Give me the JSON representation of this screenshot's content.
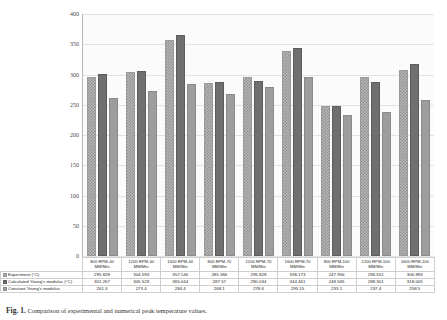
{
  "chart_data": {
    "type": "bar",
    "title": "",
    "xlabel": "",
    "ylabel": "Temperature °C",
    "ylim": [
      0,
      400
    ],
    "yticks": [
      0,
      50,
      100,
      150,
      200,
      250,
      300,
      350,
      400
    ],
    "grid": true,
    "legend_position": "data-table-rows",
    "categories": [
      "800 RPM-40 MM/Min",
      "1200 RPM-40 MM/Min",
      "1600 RPM-40 MM/Min",
      "800 RPM-70 MM/Min",
      "1200 RPM-70 MM/Min",
      "1600 RPM-70 MM/Min",
      "800 RPM-100 MM/Min",
      "1200 RPM-100 MM/Min",
      "1600 RPM-100 MM/Min"
    ],
    "categories_line1": [
      "800 RPM-40",
      "1200 RPM-40",
      "1600 RPM-40",
      "800 RPM-70",
      "1200 RPM-70",
      "1600 RPM-70",
      "800 RPM-100",
      "1200 RPM-100",
      "1600 RPM-100"
    ],
    "categories_line2": [
      "MM/Min",
      "MM/Min",
      "MM/Min",
      "MM/Min",
      "MM/Min",
      "MM/Min",
      "MM/Min",
      "MM/Min",
      "MM/Min"
    ],
    "series": [
      {
        "name": "Experiment (°C)",
        "style": "hatched",
        "color": "#b6b6b6",
        "values": [
          295.828,
          304.593,
          357.146,
          285.366,
          295.828,
          338.173,
          247.956,
          296.551,
          306.893
        ]
      },
      {
        "name": "Calculated Young's modulus (°C)",
        "style": "solid-dark",
        "color": "#6f6f6f",
        "values": [
          301.267,
          305.529,
          365.044,
          287.57,
          290.034,
          344.461,
          248.565,
          288.301,
          318.005
        ]
      },
      {
        "name": "Constant Young's modulus",
        "style": "solid-mid",
        "color": "#9d9d9d",
        "values": [
          261.3,
          273.4,
          284.4,
          268.1,
          278.6,
          295.15,
          233.1,
          237.4,
          258.5
        ]
      }
    ]
  },
  "caption": {
    "lead": "Fig. 1.",
    "text": "   Comparison of experimental and numerical peak temperature values."
  }
}
